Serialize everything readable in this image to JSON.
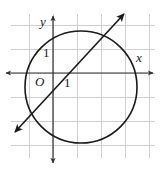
{
  "figure": {
    "background_color": "#ffffff",
    "width": 161,
    "height": 169
  },
  "grid": {
    "color": "#cfcfcf",
    "spacing": 24,
    "left": 11,
    "top": 14,
    "right": 155,
    "bottom": 158,
    "visible": true
  },
  "axes": {
    "color": "#333333",
    "x_axis": {
      "label": "x",
      "label_x": 136,
      "label_y": 62,
      "y_position": 73,
      "start_x": 6,
      "end_x": 153,
      "arrow_left": true,
      "arrow_right": true
    },
    "y_axis": {
      "label": "y",
      "label_x": 40,
      "label_y": 26,
      "x_position": 53,
      "start_y": 16,
      "end_y": 163,
      "arrow_up": true,
      "arrow_down": true
    },
    "origin_label": "O",
    "origin_label_x": 35,
    "origin_label_y": 86,
    "tick_x": {
      "label": "1",
      "label_x": 64,
      "label_y": 87,
      "value": 1
    },
    "tick_y": {
      "label": "1",
      "label_x": 43,
      "label_y": 57,
      "value": 1
    }
  },
  "chart_data": {
    "type": "scatter",
    "title": "",
    "xlabel": "x",
    "ylabel": "y",
    "grid": true,
    "xlim": [
      -1.75,
      4.25
    ],
    "ylim": [
      -3.5,
      2.45
    ],
    "unit_px": 24,
    "origin_px": [
      53,
      73
    ],
    "shapes": [
      {
        "kind": "circle",
        "name": "circle",
        "center_px": [
          81,
          87
        ],
        "radius_px": 56,
        "center_units": [
          1.17,
          -0.58
        ],
        "radius_units": 2.33,
        "stroke": "#1a1a1a",
        "stroke_width": 1.5,
        "fill": "none"
      },
      {
        "kind": "line",
        "name": "diagonal-line",
        "x1_px": 15,
        "y1_px": 132,
        "x2_px": 124,
        "y2_px": 14,
        "slope_units": 1.08,
        "arrow_start": true,
        "arrow_end": true,
        "stroke": "#1a1a1a",
        "stroke_width": 1.5
      }
    ]
  }
}
